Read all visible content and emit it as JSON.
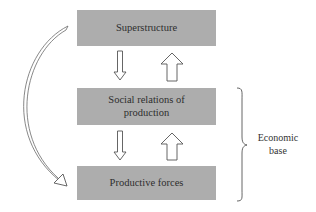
{
  "diagram": {
    "boxes": [
      {
        "id": "superstructure",
        "label": "Superstructure"
      },
      {
        "id": "social-relations",
        "label_line1": "Social relations of",
        "label_line2": "production"
      },
      {
        "id": "productive-forces",
        "label": "Productive forces"
      }
    ],
    "arrows": [
      {
        "from": "superstructure",
        "to": "social-relations",
        "style": "thin-hollow-down"
      },
      {
        "from": "social-relations",
        "to": "superstructure",
        "style": "thick-hollow-up"
      },
      {
        "from": "social-relations",
        "to": "productive-forces",
        "style": "thin-hollow-down"
      },
      {
        "from": "productive-forces",
        "to": "social-relations",
        "style": "thick-hollow-up"
      },
      {
        "from": "superstructure",
        "to": "productive-forces",
        "style": "curved-hollow-left"
      }
    ],
    "brace": {
      "spans": [
        "social-relations",
        "productive-forces"
      ],
      "label_line1": "Economic",
      "label_line2": "base"
    },
    "colors": {
      "box_fill": "#adadad",
      "text": "#2e2e2e",
      "arrow_stroke": "#555555"
    }
  }
}
